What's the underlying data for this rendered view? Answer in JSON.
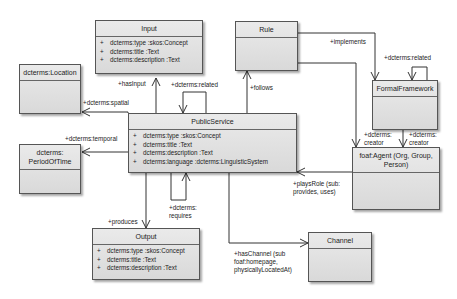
{
  "diagram": {
    "type": "UML class diagram",
    "classes": {
      "input": {
        "name": "Input",
        "attributes": [
          {
            "vis": "+",
            "name": "dcterms:type",
            "type": ":skos:Concept"
          },
          {
            "vis": "+",
            "name": "dcterms:title",
            "type": ":Text"
          },
          {
            "vis": "+",
            "name": "dcterms:description",
            "type": ":Text"
          }
        ]
      },
      "rule": {
        "name": "Rule",
        "attributes": []
      },
      "location": {
        "name": "dcterms:Location",
        "attributes": []
      },
      "formal_framework": {
        "name": "FormalFramework",
        "attributes": []
      },
      "public_service": {
        "name": "PublicService",
        "attributes": [
          {
            "vis": "+",
            "name": "dcterms:type",
            "type": ":skos:Concept"
          },
          {
            "vis": "+",
            "name": "dcterms:title",
            "type": ":Text"
          },
          {
            "vis": "+",
            "name": "dcterms:description",
            "type": ":Text"
          },
          {
            "vis": "+",
            "name": "dcterms:language",
            "type": ":dcterms:LinguisticSystem"
          }
        ]
      },
      "period_of_time": {
        "name_line1": "dcterms:",
        "name_line2": "PeriodOfTime",
        "attributes": []
      },
      "agent": {
        "name_line1": "foaf:Agent (Org, Group,",
        "name_line2": "Person)",
        "attributes": []
      },
      "output": {
        "name": "Output",
        "attributes": [
          {
            "vis": "+",
            "name": "dcterms:type",
            "type": ":skos:Concept"
          },
          {
            "vis": "+",
            "name": "dcterms:title",
            "type": ":Text"
          },
          {
            "vis": "+",
            "name": "dcterms:description",
            "type": ":Text"
          }
        ]
      },
      "channel": {
        "name": "Channel",
        "attributes": []
      }
    },
    "associations": {
      "has_input": "+hasInput",
      "related_ps": "+dcterms:related",
      "implements": "+implements",
      "related_ff": "+dcterms:related",
      "follows": "+follows",
      "spatial": "+dcterms:spatial",
      "temporal": "+dcterms:temporal",
      "creator1_l1": "+dcterms:",
      "creator1_l2": "creator",
      "creator2_l1": "+dcterms:",
      "creator2_l2": "creator",
      "plays_role_l1": "+playsRole (sub:",
      "plays_role_l2": "provides, uses)",
      "requires_l1": "+dcterms:",
      "requires_l2": "requires",
      "produces": "+produces",
      "has_channel_l1": "+hasChannel (sub",
      "has_channel_l2": "foaf:homepage,",
      "has_channel_l3": "physicallyLocatedAt)"
    }
  }
}
